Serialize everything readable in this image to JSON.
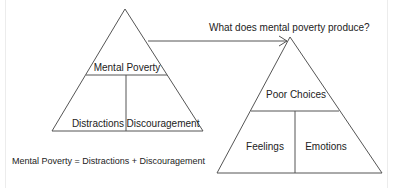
{
  "diagram": {
    "left_pyramid": {
      "top": "Mental Poverty",
      "bottom_left": "Distractions",
      "bottom_right": "Discouragement"
    },
    "arrow_label": "What does mental poverty produce?",
    "right_pyramid": {
      "top": "Poor Choices",
      "bottom_left": "Feelings",
      "bottom_right": "Emotions"
    },
    "formula": "Mental Poverty = Distractions + Discouragement",
    "colors": {
      "line": "#555555",
      "text": "#222222",
      "background": "#ffffff"
    }
  }
}
